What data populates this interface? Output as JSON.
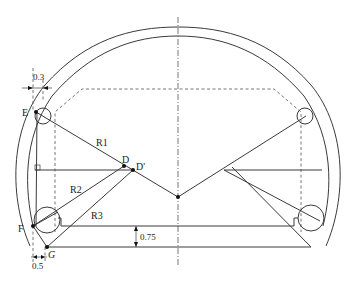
{
  "figure": {
    "labels": {
      "E": "E",
      "F": "F",
      "G": "G",
      "D": "D",
      "D_prime": "D'",
      "R1": "R1",
      "R2": "R2",
      "R3": "R3"
    },
    "dimensions": {
      "top_offset": "0.3",
      "bottom_offset": "0.5",
      "height_step": "0.75"
    },
    "colors": {
      "line": "#3a3a3a",
      "background": "#ffffff"
    }
  }
}
